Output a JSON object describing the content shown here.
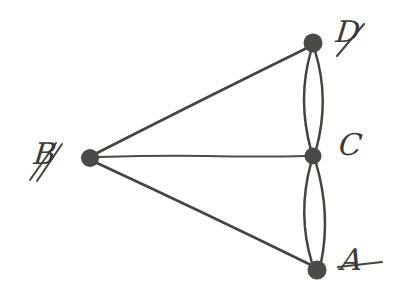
{
  "figure": {
    "kind": "hand-drawn-graph-diagram",
    "background_color": "#ffffff",
    "ink_color": "#45453f",
    "node_color": "#4a4a46",
    "width": 417,
    "height": 301
  },
  "graph": {
    "nodes": [
      {
        "id": "B",
        "label": "B",
        "label_style": "cursive-script",
        "x": 90,
        "y": 158,
        "r": 9,
        "label_x": 36,
        "label_y": 140
      },
      {
        "id": "D",
        "label": "D",
        "label_style": "cursive-script",
        "x": 313,
        "y": 43,
        "r": 9.5,
        "label_x": 339,
        "label_y": 18
      },
      {
        "id": "C",
        "label": "C",
        "label_style": "cursive-script",
        "x": 313,
        "y": 156,
        "r": 8.5,
        "label_x": 340,
        "label_y": 131
      },
      {
        "id": "A",
        "label": "A",
        "label_style": "cursive-script",
        "x": 317,
        "y": 270,
        "r": 9.5,
        "label_x": 343,
        "label_y": 246
      }
    ],
    "edges": [
      {
        "from": "B",
        "to": "D",
        "type": "straight",
        "multiplicity": 1
      },
      {
        "from": "B",
        "to": "C",
        "type": "straight",
        "multiplicity": 1
      },
      {
        "from": "B",
        "to": "A",
        "type": "straight",
        "multiplicity": 1
      },
      {
        "from": "D",
        "to": "C",
        "type": "curved-pair",
        "multiplicity": 2,
        "bow": 14
      },
      {
        "from": "C",
        "to": "A",
        "type": "curved-pair",
        "multiplicity": 2,
        "bow": 14
      }
    ],
    "degrees": {
      "A": 3,
      "B": 3,
      "C": 5,
      "D": 3
    },
    "edge_count": 7,
    "node_count": 4
  }
}
